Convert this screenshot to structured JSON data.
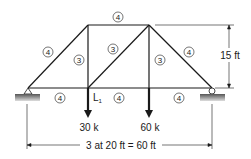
{
  "diagram": {
    "type": "truss",
    "members": [
      {
        "id": "top-chord",
        "label": "4"
      },
      {
        "id": "left-diagonal",
        "label": "4"
      },
      {
        "id": "left-vertical",
        "label": "3"
      },
      {
        "id": "center-diagonal",
        "label": "3"
      },
      {
        "id": "right-vertical",
        "label": "3"
      },
      {
        "id": "right-diagonal",
        "label": "4"
      },
      {
        "id": "bottom-chord-left",
        "label": "4"
      },
      {
        "id": "bottom-chord-center",
        "label": "4"
      },
      {
        "id": "bottom-chord-right",
        "label": "4"
      }
    ],
    "joint_label": "L",
    "joint_label_sub": "1",
    "loads": [
      {
        "label": "30 k"
      },
      {
        "label": "60 k"
      }
    ],
    "height_dim": "15 ft",
    "span_dim": "3 at 20 ft = 60 ft"
  }
}
